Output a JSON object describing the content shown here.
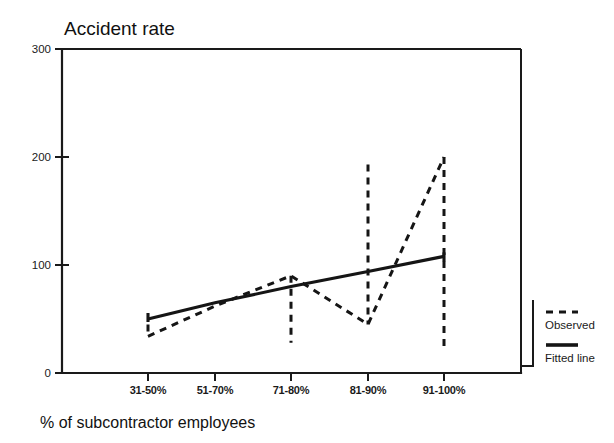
{
  "chart_data": {
    "type": "line",
    "title": "Accident rate",
    "xlabel": "% of subcontractor employees",
    "ylabel": "",
    "categories": [
      "31-50%",
      "51-70%",
      "71-80%",
      "81-90%",
      "91-100%"
    ],
    "ylim": [
      0,
      300
    ],
    "yticks": [
      0,
      100,
      200,
      300
    ],
    "ytick_labels": [
      "0",
      "100",
      "200",
      "300"
    ],
    "grid": false,
    "legend_position": "right",
    "series": [
      {
        "name": "Observed",
        "style": "dashed",
        "values": [
          34,
          62,
          90,
          45,
          200
        ]
      },
      {
        "name": "Fitted line",
        "style": "solid",
        "values": [
          50,
          65,
          80,
          94,
          108
        ]
      }
    ],
    "observed_intervals": [
      {
        "category": "31-50%",
        "low": 34,
        "high": 45
      },
      {
        "category": "71-80%",
        "low": 28,
        "high": 90
      },
      {
        "category": "81-90%",
        "low": 45,
        "high": 193
      },
      {
        "category": "91-100%",
        "low": 22,
        "high": 200
      }
    ],
    "legend": [
      {
        "label": "Observed",
        "style": "dashed"
      },
      {
        "label": "Fitted line",
        "style": "solid"
      }
    ]
  }
}
